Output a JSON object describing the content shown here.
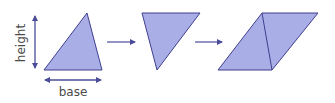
{
  "diagram": {
    "labels": {
      "height": "height",
      "base": "base"
    },
    "colors": {
      "fill": "#a9aee6",
      "stroke": "#3f3f8f",
      "arrow": "#4b4c99",
      "text": "#4a4a4a"
    },
    "shapes": [
      {
        "id": "triangle-original",
        "points": "87,13 102,70 44,70"
      },
      {
        "id": "triangle-rotated",
        "points": "142,13 200,13 157,70"
      },
      {
        "id": "parallelogram",
        "points": "262,13 318,13 272,70 218,70",
        "diagonal": [
          262,
          13,
          272,
          70
        ]
      }
    ],
    "arrows": [
      {
        "id": "transform-arrow-1",
        "x1": 107,
        "x2": 135,
        "y": 42
      },
      {
        "id": "transform-arrow-2",
        "x1": 195,
        "x2": 222,
        "y": 42
      }
    ]
  }
}
